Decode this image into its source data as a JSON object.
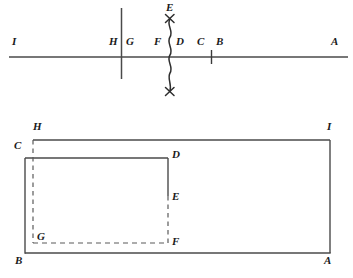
{
  "figure": {
    "title": "",
    "background_color": "#ffffff",
    "line_color": "#454545",
    "label_color": "#1a1a1a",
    "top_diagram": {
      "name": "number-line-diagram",
      "description": "Horizontal line with labeled points and a wavy vertical cut line",
      "labels": [
        {
          "text": "I",
          "x": 14,
          "y": 41
        },
        {
          "text": "H",
          "x": 111,
          "y": 41
        },
        {
          "text": "G",
          "x": 126,
          "y": 41
        },
        {
          "text": "F",
          "x": 159,
          "y": 41
        },
        {
          "text": "D",
          "x": 178,
          "y": 41
        },
        {
          "text": "C",
          "x": 199,
          "y": 41
        },
        {
          "text": "B",
          "x": 218,
          "y": 41
        },
        {
          "text": "A",
          "x": 332,
          "y": 41
        },
        {
          "text": "E",
          "x": 167,
          "y": 5
        }
      ],
      "horizontal_line": {
        "x1": 9,
        "y1": 57,
        "x2": 348,
        "y2": 57
      },
      "vertical_line_HG": {
        "x": 121,
        "y1": 8,
        "y2": 79
      },
      "tick_CB": {
        "x": 211,
        "y1": 51,
        "y2": 63
      },
      "wavy_line_FD": {
        "x": 170,
        "y1": 15,
        "y2": 96
      },
      "x_mark_top": {
        "x": 170,
        "y": 18
      },
      "x_mark_bottom": {
        "x": 170,
        "y": 92
      }
    },
    "bottom_diagram": {
      "name": "nested-rectangles-diagram",
      "description": "Outer rectangle H I A B with inner rectangle C D F G, partly dashed",
      "labels": [
        {
          "text": "H",
          "x": 33,
          "y": 126
        },
        {
          "text": "I",
          "x": 327,
          "y": 126
        },
        {
          "text": "C",
          "x": 15,
          "y": 144
        },
        {
          "text": "D",
          "x": 172,
          "y": 151
        },
        {
          "text": "E",
          "x": 172,
          "y": 192
        },
        {
          "text": "G",
          "x": 37,
          "y": 234
        },
        {
          "text": "F",
          "x": 172,
          "y": 238
        },
        {
          "text": "B",
          "x": 16,
          "y": 256
        },
        {
          "text": "A",
          "x": 325,
          "y": 256
        }
      ],
      "solid_segments": [
        {
          "name": "edge-H-I",
          "x1": 33,
          "y1": 140,
          "x2": 330,
          "y2": 140
        },
        {
          "name": "edge-I-A",
          "x1": 330,
          "y1": 140,
          "x2": 330,
          "y2": 253
        },
        {
          "name": "edge-A-B",
          "x1": 330,
          "y1": 253,
          "x2": 25,
          "y2": 253
        },
        {
          "name": "edge-B-C",
          "x1": 25,
          "y1": 253,
          "x2": 25,
          "y2": 158
        },
        {
          "name": "edge-C-D",
          "x1": 25,
          "y1": 158,
          "x2": 168,
          "y2": 158
        },
        {
          "name": "edge-D-E",
          "x1": 168,
          "y1": 158,
          "x2": 168,
          "y2": 196
        }
      ],
      "dashed_segments": [
        {
          "name": "edge-H-G",
          "x1": 33,
          "y1": 140,
          "x2": 33,
          "y2": 243
        },
        {
          "name": "edge-E-F",
          "x1": 168,
          "y1": 196,
          "x2": 168,
          "y2": 243
        },
        {
          "name": "edge-G-F",
          "x1": 33,
          "y1": 243,
          "x2": 168,
          "y2": 243
        }
      ]
    }
  }
}
